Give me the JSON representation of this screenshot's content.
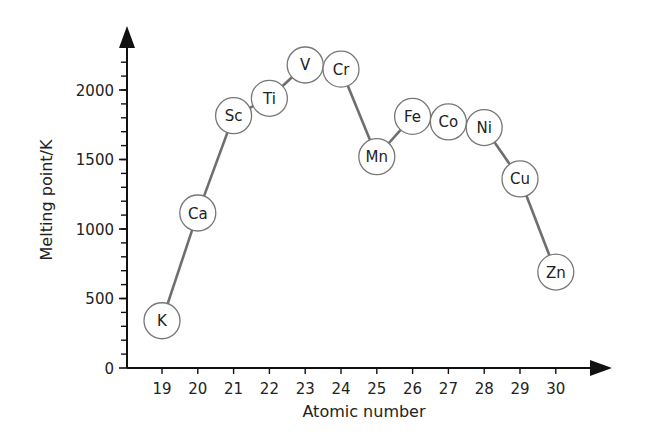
{
  "chart_data": {
    "type": "line",
    "title": "",
    "xlabel": "Atomic number",
    "ylabel": "Melting point/K",
    "x": [
      19,
      20,
      21,
      22,
      23,
      24,
      25,
      26,
      27,
      28,
      29,
      30
    ],
    "point_labels": [
      "K",
      "Ca",
      "Sc",
      "Ti",
      "V",
      "Cr",
      "Mn",
      "Fe",
      "Co",
      "Ni",
      "Cu",
      "Zn"
    ],
    "values": [
      340,
      1115,
      1815,
      1940,
      2180,
      2150,
      1520,
      1810,
      1770,
      1730,
      1360,
      690
    ],
    "x_ticks": [
      "19",
      "20",
      "21",
      "22",
      "23",
      "24",
      "25",
      "26",
      "27",
      "28",
      "29",
      "30"
    ],
    "y_ticks": [
      "0",
      "500",
      "1000",
      "1500",
      "2000"
    ],
    "y_tick_values": [
      0,
      500,
      1000,
      1500,
      2000
    ],
    "ylim": [
      0,
      2300
    ],
    "xlim": [
      18,
      31
    ],
    "y_minor_tick_step": 100,
    "grid": false,
    "legend": null,
    "marker": "circle-with-element-symbol",
    "line_color": "#6e6e6e",
    "axis_color": "#111111"
  }
}
